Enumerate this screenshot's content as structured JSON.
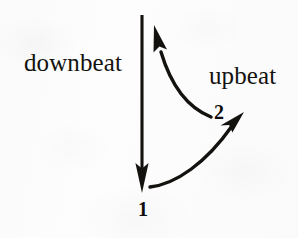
{
  "figure": {
    "kind": "conducting-pattern-diagram",
    "caption_labels": {
      "downbeat": "downbeat",
      "upbeat": "upbeat"
    },
    "beat_numbers": {
      "beat_1": "1",
      "beat_2": "2"
    },
    "colors": {
      "ink": "#14120f",
      "paper": "#fdfdfd"
    },
    "strokes": {
      "downbeat_shaft": {
        "name": "downbeat-stroke",
        "from_x": 142,
        "from_y": 15,
        "to_x": 142,
        "to_y": 172,
        "arrow": "down",
        "arrow_tip_x": 142,
        "arrow_tip_y": 193
      },
      "rebound_curve": {
        "name": "upbeat-rebound-curve",
        "from_x": 210,
        "from_y": 116,
        "to_x": 158,
        "to_y": 45,
        "arrow": "up-left",
        "arrow_tip_x": 154,
        "arrow_tip_y": 25
      },
      "upbeat_curve": {
        "name": "upbeat-sweep-curve",
        "from_x": 151,
        "from_y": 187,
        "to_x": 236,
        "to_y": 122,
        "arrow": "up-right",
        "arrow_tip_x": 244,
        "arrow_tip_y": 112
      }
    }
  }
}
